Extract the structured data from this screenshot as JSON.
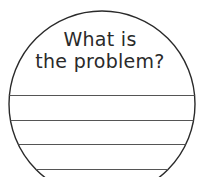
{
  "worksheet": {
    "prompt_line1": "What is",
    "prompt_line2": "the problem?",
    "shape": "circle",
    "writing_lines_count": 4,
    "colors": {
      "stroke": "#2a2a2a",
      "line": "#555555",
      "background": "#ffffff"
    }
  }
}
